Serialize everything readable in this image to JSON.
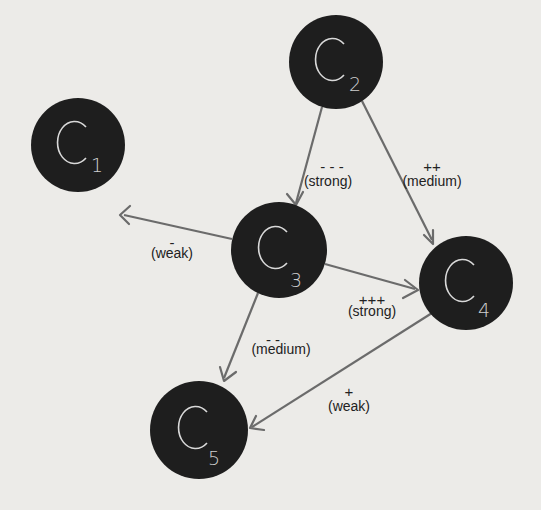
{
  "diagram": {
    "type": "causal-loop / concept influence graph",
    "nodes": [
      {
        "id": "C1",
        "letter": "C",
        "subscript": "1",
        "cx": 78,
        "cy": 145,
        "r": 47
      },
      {
        "id": "C2",
        "letter": "C",
        "subscript": "2",
        "cx": 336,
        "cy": 62,
        "r": 47
      },
      {
        "id": "C3",
        "letter": "C",
        "subscript": "3",
        "cx": 279,
        "cy": 250,
        "r": 48
      },
      {
        "id": "C4",
        "letter": "C",
        "subscript": "4",
        "cx": 466,
        "cy": 283,
        "r": 47
      },
      {
        "id": "C5",
        "letter": "C",
        "subscript": "5",
        "cx": 199,
        "cy": 430,
        "r": 49
      }
    ],
    "edges": [
      {
        "from": "C2",
        "to": "C3",
        "sign": "- - -",
        "strength": "(strong)"
      },
      {
        "from": "C2",
        "to": "C4",
        "sign": "++",
        "strength": "(medium)"
      },
      {
        "from": "C3",
        "to": "C1",
        "sign": "-",
        "strength": "(weak)"
      },
      {
        "from": "C3",
        "to": "C4",
        "sign": "+++",
        "strength": "(strong)"
      },
      {
        "from": "C3",
        "to": "C5",
        "sign": "- -",
        "strength": "(medium)"
      },
      {
        "from": "C4",
        "to": "C5",
        "sign": "+",
        "strength": "(weak)"
      }
    ]
  },
  "colors": {
    "background": "#ecebe8",
    "node_fill": "#1e1e1e",
    "node_text": "#d9d9d9",
    "edge": "#6b6b6b",
    "label": "#222222"
  }
}
